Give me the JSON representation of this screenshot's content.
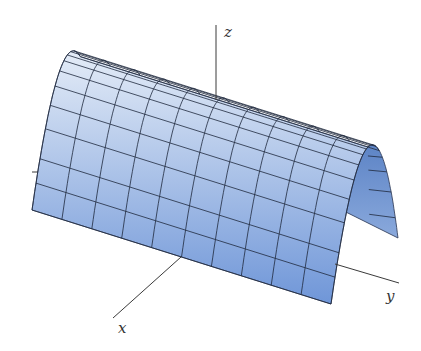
{
  "figure": {
    "axes": {
      "x_label": "x",
      "y_label": "y",
      "z_label": "z"
    },
    "surface": {
      "type": "parabolic-cylinder",
      "grid_rows": 10,
      "grid_cols": 10,
      "colors": {
        "top": "#e4ecf7",
        "bottom": "#6f96d8",
        "inner": "#5d84c6",
        "inner_light": "#8aa9dc",
        "gridline": "#1f2a3d"
      }
    }
  },
  "geometry": {
    "ridge_start": [
      69,
      53
    ],
    "ridge_dir": [
      299,
      94
    ],
    "ex": [
      -33.5,
      33
    ],
    "ez": [
      -3.5,
      124
    ],
    "z_axis": {
      "x1": 216,
      "y1": 25,
      "x2": 216,
      "y2": 100,
      "label_pos": [
        224,
        37
      ]
    },
    "x_axis": {
      "x1": 181,
      "y1": 257,
      "x2": 113,
      "y2": 318,
      "label_pos": [
        118,
        333
      ]
    },
    "y_axis": {
      "x1": 335,
      "y1": 264,
      "x2": 399,
      "y2": 283,
      "label_pos": [
        386,
        301
      ]
    },
    "left_stub": {
      "x1": 32,
      "y1": 172,
      "x2": 40,
      "y2": 172
    }
  }
}
